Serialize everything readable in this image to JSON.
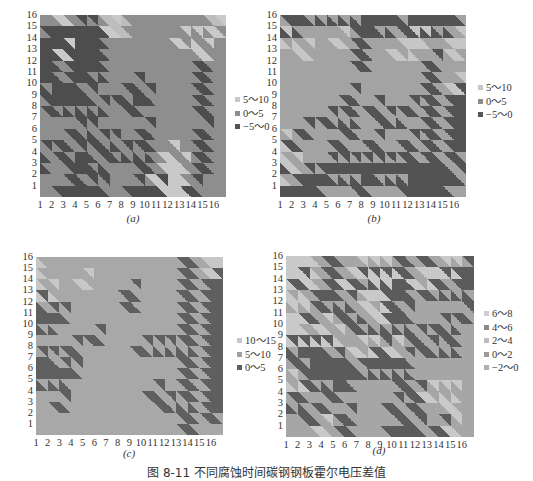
{
  "figure": {
    "title": "图 8-11   不同腐蚀时间碳钢钢板霍尔电压差值",
    "panels": [
      {
        "id": "a",
        "caption": "(a)",
        "plot": {
          "left": 40,
          "top": 15,
          "width": 186,
          "height": 182
        },
        "legend": {
          "left": 235,
          "top": 93,
          "items": [
            {
              "label": "5～10",
              "color": "#c8c8c8"
            },
            {
              "label": "0～5",
              "color": "#8c8c8c"
            },
            {
              "label": "−5～0",
              "color": "#555555"
            }
          ]
        },
        "caption_pos": {
          "left": 118,
          "top": 212
        }
      },
      {
        "id": "b",
        "caption": "(b)",
        "plot": {
          "left": 280,
          "top": 15,
          "width": 186,
          "height": 182
        },
        "legend": {
          "left": 478,
          "top": 81,
          "items": [
            {
              "label": "5～10",
              "color": "#c8c8c8"
            },
            {
              "label": "0～5",
              "color": "#8c8c8c"
            },
            {
              "label": "−5～0",
              "color": "#555555"
            }
          ]
        },
        "caption_pos": {
          "left": 359,
          "top": 212
        }
      },
      {
        "id": "c",
        "caption": "(c)",
        "plot": {
          "left": 36,
          "top": 257,
          "width": 187,
          "height": 178
        },
        "legend": {
          "left": 237,
          "top": 334,
          "items": [
            {
              "label": "10～15",
              "color": "#c8c8c8"
            },
            {
              "label": "5～10",
              "color": "#a0a0a0"
            },
            {
              "label": "0～5",
              "color": "#5e5e5e"
            }
          ]
        },
        "caption_pos": {
          "left": 114,
          "top": 447
        }
      },
      {
        "id": "d",
        "caption": "(d)",
        "plot": {
          "left": 286,
          "top": 256,
          "width": 188,
          "height": 181
        },
        "legend": {
          "left": 484,
          "top": 307,
          "items": [
            {
              "label": "6～8",
              "color": "#cfcfcf"
            },
            {
              "label": "4～6",
              "color": "#8a8a8a"
            },
            {
              "label": "2～4",
              "color": "#bdbdbd"
            },
            {
              "label": "0～2",
              "color": "#9a9a9a"
            },
            {
              "label": "−2～0",
              "color": "#b0b0b0"
            }
          ]
        },
        "caption_pos": {
          "left": 364,
          "top": 444
        }
      }
    ]
  },
  "chart_data": [
    {
      "type": "heatmap",
      "title": "(a)",
      "xlabel": "",
      "ylabel": "",
      "x": [
        1,
        2,
        3,
        4,
        5,
        6,
        7,
        8,
        9,
        10,
        11,
        12,
        13,
        14,
        15,
        16
      ],
      "y": [
        1,
        2,
        3,
        4,
        5,
        6,
        7,
        8,
        9,
        10,
        11,
        12,
        13,
        14,
        15,
        16
      ],
      "legend": [
        "5～10",
        "0～5",
        "−5～0"
      ],
      "grid_levels_top_to_bottom": [
        "2212223322222223",
        "2000001322222221",
        "0000002222221122",
        "0010002222222212",
        "0020002222222202",
        "0020002222222202",
        "0000222202222202",
        "2000022000222202",
        "2000002202222202",
        "2222222222222222",
        "2220022220222202",
        "2202200220222202",
        "0200020000212202",
        "0220002220211202",
        "2220222222111222",
        "2200002200011022"
      ]
    },
    {
      "type": "heatmap",
      "title": "(b)",
      "xlabel": "",
      "ylabel": "",
      "x": [
        1,
        2,
        3,
        4,
        5,
        6,
        7,
        8,
        9,
        10,
        11,
        12,
        13,
        14,
        15,
        16
      ],
      "y": [
        1,
        2,
        3,
        4,
        5,
        6,
        7,
        8,
        9,
        10,
        11,
        12,
        13,
        14,
        15,
        16
      ],
      "legend": [
        "5～10",
        "0～5",
        "−5～0"
      ],
      "grid_levels_top_to_bottom": [
        "2000000000000000",
        "0022222000200002",
        "1122212022211221",
        "2212222022112221",
        "2222222022222022",
        "2222222222222022",
        "2222222222222021",
        "2222220222222020",
        "2222220202202020",
        "2222000220022020",
        "2202220222222020",
        "1022202202202020",
        "1222222222202020",
        "0122000000000002",
        "1200000000000000",
        "0000222022200002"
      ]
    },
    {
      "type": "heatmap",
      "title": "(c)",
      "xlabel": "",
      "ylabel": "",
      "x": [
        1,
        2,
        3,
        4,
        5,
        6,
        7,
        8,
        9,
        10,
        11,
        12,
        13,
        14,
        15,
        16
      ],
      "y": [
        1,
        2,
        3,
        4,
        5,
        6,
        7,
        8,
        9,
        10,
        11,
        12,
        13,
        14,
        15,
        16
      ],
      "legend": [
        "10～15",
        "5～10",
        "0～5"
      ],
      "grid_levels_top_to_bottom": [
        "0111111111111210",
        "0111111111111210",
        "0111011111111212",
        "0011111121111212",
        "2111111121111212",
        "2221111111111212",
        "2211111111111212",
        "1111121111111212",
        "1112111112222212",
        "2211111111111212",
        "2222111111111212",
        "2221111111111212",
        "1111111111211212",
        "1121111111122212",
        "1111111111111212",
        "1111111111111211"
      ]
    },
    {
      "type": "heatmap",
      "title": "(d)",
      "xlabel": "",
      "ylabel": "",
      "x": [
        1,
        2,
        3,
        4,
        5,
        6,
        7,
        8,
        9,
        10,
        11,
        12,
        13,
        14,
        15,
        16
      ],
      "y": [
        1,
        2,
        3,
        4,
        5,
        6,
        7,
        8,
        9,
        10,
        11,
        12,
        13,
        14,
        15,
        16
      ],
      "legend": [
        "6～8",
        "4～6",
        "2～4",
        "0～2",
        "−2～0"
      ],
      "grid_levels_top_to_bottom": [
        "2221011111010111",
        "2221012222012220",
        "2021020000022010",
        "2210011220010000",
        "1110001220111111",
        "2201100120011110",
        "2212110000011001",
        "2222211111101101",
        "0000112202110001",
        "1000001000011111",
        "1100000000011111",
        "2200001111011111",
        "1011011111102221",
        "0010111110101121",
        "1101101111011111",
        "1112101110001021"
      ]
    }
  ],
  "palettes": {
    "a": {
      "0": "#4d4d4d",
      "1": "#c9c9c9",
      "2": "#8e8e8e",
      "3": "#bdbdbd"
    },
    "b": {
      "0": "#535353",
      "1": "#c6c6c6",
      "2": "#a3a3a3"
    },
    "c": {
      "0": "#c7c7c7",
      "1": "#a8a8a8",
      "2": "#5f5f5f"
    },
    "d": {
      "0": "#5b5b5b",
      "1": "#a6a6a6",
      "2": "#c9c9c9"
    }
  },
  "axis_ticks": {
    "x": [
      "1",
      "2",
      "3",
      "4",
      "5",
      "6",
      "7",
      "8",
      "9",
      "10",
      "11",
      "12",
      "13",
      "14",
      "15",
      "16"
    ],
    "y": [
      "16",
      "15",
      "14",
      "13",
      "12",
      "11",
      "10",
      "9",
      "8",
      "7",
      "6",
      "5",
      "4",
      "3",
      "2",
      "1"
    ]
  }
}
